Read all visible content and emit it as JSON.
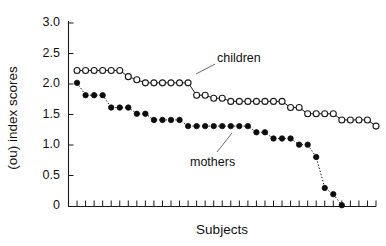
{
  "chart_data": {
    "type": "line",
    "title": "",
    "xlabel": "Subjects",
    "ylabel": "(ou) index scores",
    "ylim": [
      0,
      3.0
    ],
    "yticks": [
      0,
      0.5,
      1.0,
      1.5,
      2.0,
      2.5,
      3.0
    ],
    "ytick_labels": [
      "0",
      "0.5",
      "1.0",
      "1.5",
      "2.0",
      "2.5",
      "3.0"
    ],
    "xlim": [
      0.5,
      36.5
    ],
    "xticks_count": 36,
    "xtick_labels": [],
    "grid": false,
    "legend_position": "inline-annotations",
    "x": [
      1,
      2,
      3,
      4,
      5,
      6,
      7,
      8,
      9,
      10,
      11,
      12,
      13,
      14,
      15,
      16,
      17,
      18,
      19,
      20,
      21,
      22,
      23,
      24,
      25,
      26,
      27,
      28,
      29,
      30,
      31,
      32,
      33,
      34,
      35,
      36
    ],
    "series": [
      {
        "name": "children",
        "marker": "open-circle",
        "linestyle": "solid",
        "values": [
          2.2,
          2.2,
          2.2,
          2.2,
          2.2,
          2.2,
          2.1,
          2.05,
          2.0,
          2.0,
          2.0,
          2.0,
          2.0,
          2.0,
          1.8,
          1.8,
          1.75,
          1.75,
          1.7,
          1.7,
          1.7,
          1.7,
          1.7,
          1.7,
          1.7,
          1.6,
          1.6,
          1.5,
          1.5,
          1.5,
          1.5,
          1.4,
          1.4,
          1.4,
          1.4,
          1.3
        ]
      },
      {
        "name": "mothers",
        "marker": "filled-circle",
        "linestyle": "dotted",
        "values": [
          2.0,
          1.8,
          1.8,
          1.8,
          1.6,
          1.6,
          1.6,
          1.5,
          1.5,
          1.4,
          1.4,
          1.4,
          1.4,
          1.3,
          1.3,
          1.3,
          1.3,
          1.3,
          1.3,
          1.3,
          1.3,
          1.2,
          1.2,
          1.1,
          1.1,
          1.1,
          1.0,
          1.0,
          0.8,
          0.3,
          0.2,
          0.02,
          null,
          null,
          null,
          null
        ]
      }
    ],
    "annotations": [
      {
        "name": "children",
        "text": "children",
        "x_frac": 0.46,
        "y_frac": 0.215
      },
      {
        "name": "mothers",
        "text": "mothers",
        "x_frac": 0.45,
        "y_frac": 0.7
      }
    ]
  },
  "labels": {
    "children": "children",
    "mothers": "mothers",
    "x_axis_title": "Subjects",
    "y_axis_title": "(ou) index scores"
  },
  "colors": {
    "axis": "#1a1a1a",
    "children_marker_fill": "#ffffff",
    "mothers_marker_fill": "#0d0d0d",
    "line": "#1a1a1a",
    "text": "#111111",
    "background": "#ffffff"
  }
}
